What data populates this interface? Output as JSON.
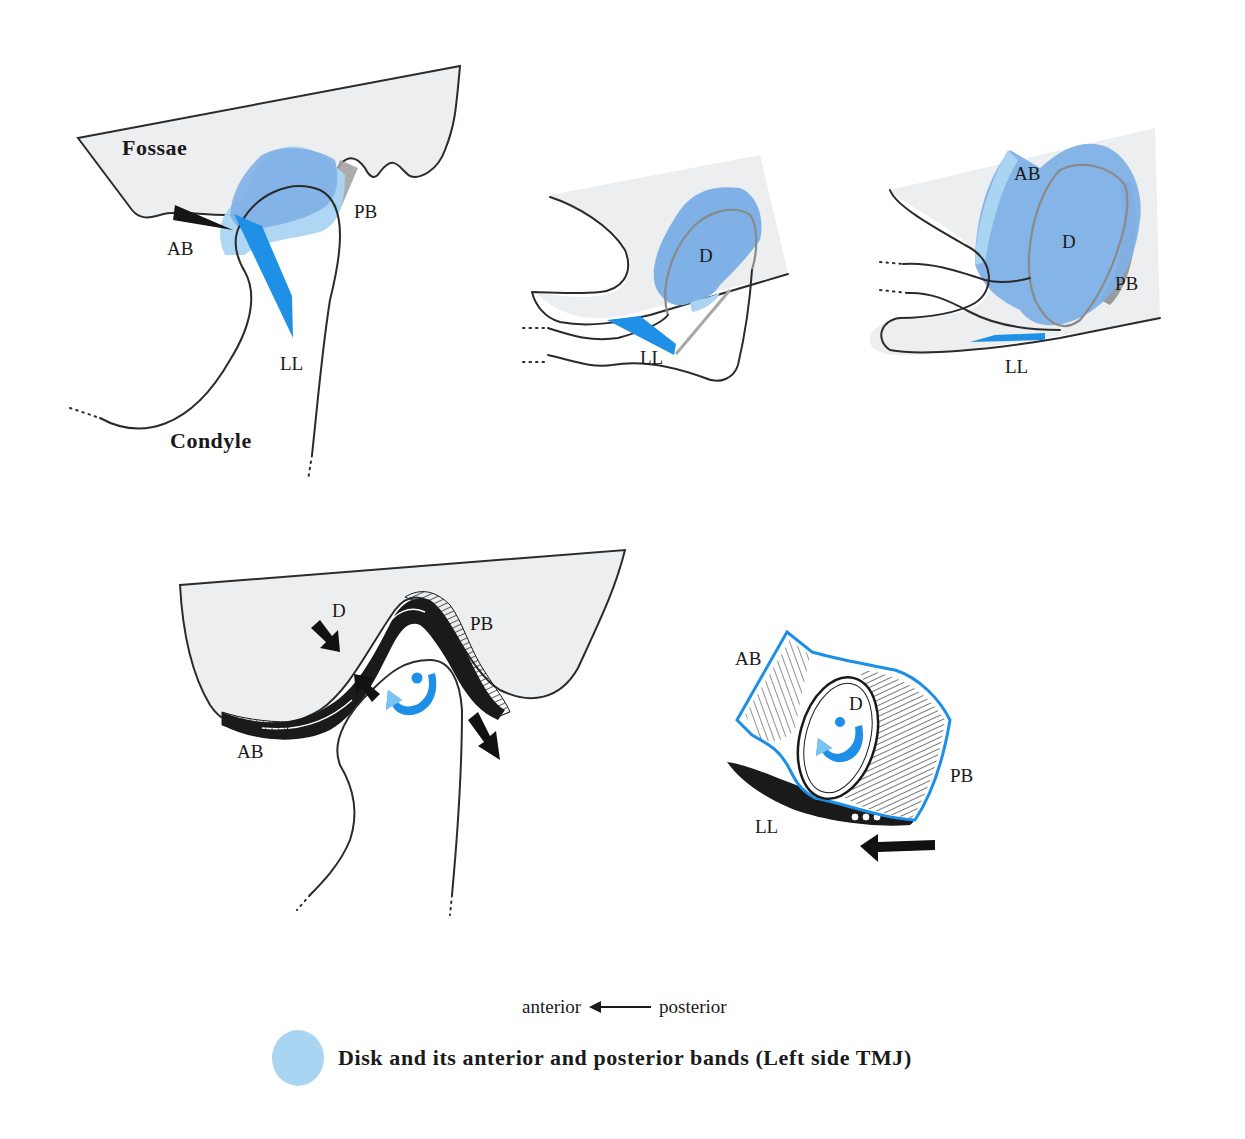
{
  "colors": {
    "disk_light": "#a9d5f2",
    "disk_dark": "#7fb0e6",
    "ligament_blue": "#1e90e6",
    "fossa_fill": "#eceef0",
    "outline": "#2b2b2b",
    "band_grey": "#a0a0a0",
    "rotation_arrow_light": "#7cc4f0",
    "rotation_arrow_dark": "#1e8fe6"
  },
  "panels": {
    "top_left": {
      "labels": {
        "fossae": "Fossae",
        "condyle": "Condyle",
        "ab": "AB",
        "pb": "PB",
        "ll": "LL"
      }
    },
    "top_middle": {
      "labels": {
        "d": "D",
        "ll": "LL"
      }
    },
    "top_right": {
      "labels": {
        "ab": "AB",
        "d": "D",
        "pb": "PB",
        "ll": "LL"
      }
    },
    "bottom_left": {
      "labels": {
        "d": "D",
        "pb": "PB",
        "ab": "AB"
      }
    },
    "bottom_right": {
      "labels": {
        "ab": "AB",
        "d": "D",
        "pb": "PB",
        "ll": "LL"
      }
    }
  },
  "legend": {
    "direction": {
      "left": "anterior",
      "right": "posterior"
    },
    "key": "Disk and its anterior and posterior bands (Left side TMJ)"
  }
}
